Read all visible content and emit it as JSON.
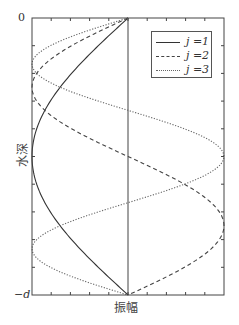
{
  "chart_data": {
    "type": "line",
    "title": "",
    "xlabel": "振幅",
    "ylabel": "水深",
    "y_tick_labels": [
      "0",
      "−d"
    ],
    "xlim": [
      -1,
      1
    ],
    "ylim": [
      0,
      1
    ],
    "y_inverted": true,
    "grid": false,
    "legend_position": "upper right",
    "legend": [
      "j =1",
      "j =2",
      "j =3"
    ],
    "series": [
      {
        "name": "j =1",
        "mode": 1,
        "style": "solid",
        "formula": "amplitude = -sin(1*pi*depth)"
      },
      {
        "name": "j =2",
        "mode": 2,
        "style": "dashed",
        "formula": "amplitude = -sin(2*pi*depth)"
      },
      {
        "name": "j =3",
        "mode": 3,
        "style": "dotted",
        "formula": "amplitude = -sin(3*pi*depth)"
      }
    ],
    "x_ticks_count": 10,
    "y_ticks_count": 10,
    "zero_line": true
  },
  "labels": {
    "top": "0",
    "bottom": "−d",
    "x": "振幅",
    "y": "水深"
  },
  "legend": [
    {
      "label": "j =1"
    },
    {
      "label": "j =2"
    },
    {
      "label": "j =3"
    }
  ],
  "colors": {
    "axis": "#444444",
    "line": "#333333",
    "dotted": "#666666"
  }
}
